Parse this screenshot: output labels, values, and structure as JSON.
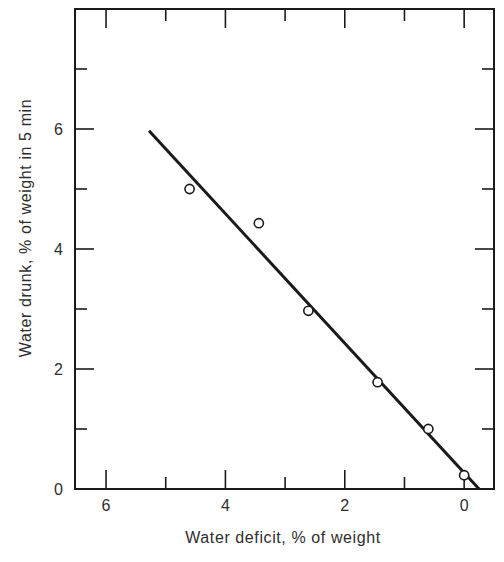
{
  "chart_data": {
    "type": "scatter",
    "title": "",
    "xlabel": "Water deficit, % of weight",
    "ylabel": "Water drunk, % of weight in 5 min",
    "xlim": [
      6.52,
      -0.5
    ],
    "ylim": [
      0,
      8
    ],
    "x_reversed": true,
    "grid": false,
    "legend": null,
    "x_ticks": [
      6,
      4,
      2,
      0
    ],
    "x_tick_labels": [
      "6",
      "4",
      "2",
      "0"
    ],
    "x_minor_ticks": [
      5,
      3,
      1
    ],
    "y_ticks": [
      0,
      2,
      4,
      6
    ],
    "y_tick_labels": [
      "0",
      "2",
      "4",
      "6"
    ],
    "y_minor_ticks": [
      1,
      3,
      5,
      7
    ],
    "series": [
      {
        "name": "Observations",
        "marker": "open-circle",
        "x": [
          4.6,
          3.44,
          2.61,
          1.45,
          0.6,
          0.0
        ],
        "y": [
          5.0,
          4.43,
          2.97,
          1.78,
          1.0,
          0.23
        ]
      },
      {
        "name": "Fitted line",
        "style": "line",
        "x": [
          5.28,
          -0.25
        ],
        "y": [
          5.97,
          0.0
        ]
      }
    ]
  },
  "colors": {
    "ink": "#1a1a1a",
    "text": "#2e2e2e",
    "background": "#ffffff"
  }
}
